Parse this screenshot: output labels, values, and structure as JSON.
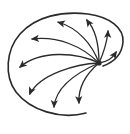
{
  "diagram": {
    "type": "vector-field-icon",
    "colors": {
      "stroke": "#2a2a2a",
      "background": "#ffffff"
    },
    "source_point": {
      "x": 99,
      "y": 63
    },
    "boundary_path": "M86,113 C60,120 30,110 16,92 C4,76 6,50 20,34 C36,16 62,11 88,14 C110,17 124,28 123,42 C122,54 114,62 103,66",
    "arrows": [
      {
        "name": "arrow-right-up",
        "path": "M99,63 C106,62 113,58 116,52",
        "head": {
          "x": 117,
          "y": 51,
          "angle": -55
        }
      },
      {
        "name": "arrow-up-right",
        "path": "M99,63 C104,52 107,42 108,31",
        "head": {
          "x": 108,
          "y": 30,
          "angle": -88
        }
      },
      {
        "name": "arrow-up",
        "path": "M99,63 C99,46 96,30 87,20",
        "head": {
          "x": 86,
          "y": 19,
          "angle": -125
        }
      },
      {
        "name": "arrow-up-left",
        "path": "M99,63 C92,44 78,28 58,22",
        "head": {
          "x": 57,
          "y": 22,
          "angle": -165
        }
      },
      {
        "name": "arrow-left",
        "path": "M99,63 C82,46 58,36 32,39",
        "head": {
          "x": 31,
          "y": 39,
          "angle": 175
        }
      },
      {
        "name": "arrow-lower-left",
        "path": "M99,63 C76,52 40,50 20,67",
        "head": {
          "x": 19,
          "y": 68,
          "angle": 140
        }
      },
      {
        "name": "arrow-down-left",
        "path": "M99,63 C76,64 40,74 30,94",
        "head": {
          "x": 29,
          "y": 95,
          "angle": 115
        }
      },
      {
        "name": "arrow-down",
        "path": "M99,63 C78,72 56,86 54,107",
        "head": {
          "x": 54,
          "y": 108,
          "angle": 92
        }
      },
      {
        "name": "arrow-down-right",
        "path": "M99,63 C86,74 78,88 79,103",
        "head": {
          "x": 79,
          "y": 104,
          "angle": 88
        }
      }
    ]
  }
}
